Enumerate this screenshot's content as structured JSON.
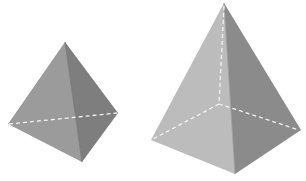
{
  "figure": {
    "shapes": [
      {
        "name": "triangular-pyramid",
        "faces": 4,
        "colors": {
          "front_left": "#9b9b9b",
          "front_right": "#7e7e7e"
        },
        "hidden_edge_color": "#f2f2f2"
      },
      {
        "name": "square-pyramid",
        "faces": 5,
        "colors": {
          "front_left": "#bcbcbc",
          "front_right": "#8b8b8b"
        },
        "hidden_edge_color": "#f2f2f2"
      }
    ]
  }
}
